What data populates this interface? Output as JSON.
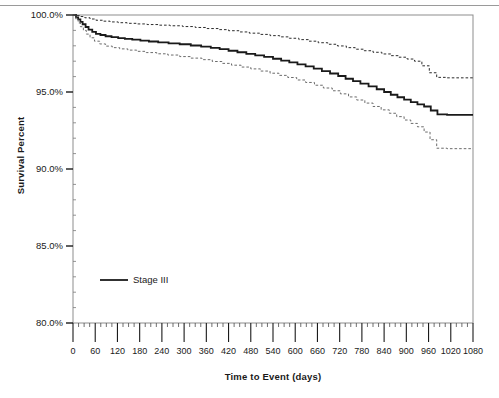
{
  "figure": {
    "background_color": "#ffffff",
    "top_rule_color": "#9a9a9a",
    "frame_color": "#888888",
    "axis_color": "#1a1a1a"
  },
  "legend": {
    "entries": [
      {
        "label": "Stage III",
        "style": "solid",
        "color": "#1a1a1a"
      }
    ]
  },
  "chart_data": {
    "type": "line",
    "subtype": "kaplan-meier-step",
    "title": "",
    "xlabel": "Time to Event (days)",
    "ylabel": "Survival Percent",
    "xlim": [
      0,
      1080
    ],
    "ylim": [
      80,
      100
    ],
    "grid": false,
    "legend_position": "inside-lower-left",
    "x_major_step": 60,
    "x_minor_per_major": 4,
    "y_major_step": 5,
    "y_minor_per_major": 5,
    "xticks": [
      0,
      60,
      120,
      180,
      240,
      300,
      360,
      420,
      480,
      540,
      600,
      660,
      720,
      780,
      840,
      900,
      960,
      1020,
      1080
    ],
    "xticklabels": [
      "0",
      "60",
      "120",
      "180",
      "240",
      "300",
      "360",
      "420",
      "480",
      "540",
      "600",
      "660",
      "720",
      "780",
      "840",
      "900",
      "960",
      "1020",
      "1080"
    ],
    "yticks": [
      80,
      85,
      90,
      95,
      100
    ],
    "yticklabels": [
      "80.0%",
      "85.0%",
      "90.0%",
      "95.0%",
      "100.0%"
    ],
    "series": [
      {
        "name": "Stage III",
        "style": "solid",
        "color": "#1a1a1a",
        "width": 1.8,
        "points": [
          [
            0,
            100.0
          ],
          [
            8,
            99.85
          ],
          [
            14,
            99.72
          ],
          [
            20,
            99.55
          ],
          [
            26,
            99.4
          ],
          [
            34,
            99.22
          ],
          [
            42,
            99.05
          ],
          [
            52,
            98.9
          ],
          [
            62,
            98.78
          ],
          [
            74,
            98.7
          ],
          [
            88,
            98.62
          ],
          [
            104,
            98.56
          ],
          [
            122,
            98.5
          ],
          [
            140,
            98.45
          ],
          [
            160,
            98.4
          ],
          [
            182,
            98.34
          ],
          [
            205,
            98.28
          ],
          [
            230,
            98.22
          ],
          [
            258,
            98.16
          ],
          [
            288,
            98.1
          ],
          [
            318,
            98.02
          ],
          [
            346,
            97.94
          ],
          [
            372,
            97.86
          ],
          [
            396,
            97.78
          ],
          [
            420,
            97.68
          ],
          [
            444,
            97.58
          ],
          [
            468,
            97.48
          ],
          [
            492,
            97.38
          ],
          [
            516,
            97.28
          ],
          [
            540,
            97.16
          ],
          [
            562,
            97.04
          ],
          [
            584,
            96.92
          ],
          [
            606,
            96.8
          ],
          [
            628,
            96.66
          ],
          [
            650,
            96.52
          ],
          [
            672,
            96.36
          ],
          [
            694,
            96.2
          ],
          [
            716,
            96.04
          ],
          [
            736,
            95.86
          ],
          [
            756,
            95.7
          ],
          [
            776,
            95.54
          ],
          [
            798,
            95.36
          ],
          [
            820,
            95.18
          ],
          [
            840,
            95.0
          ],
          [
            858,
            94.82
          ],
          [
            876,
            94.66
          ],
          [
            894,
            94.5
          ],
          [
            912,
            94.34
          ],
          [
            930,
            94.2
          ],
          [
            948,
            94.06
          ],
          [
            966,
            93.8
          ],
          [
            984,
            93.55
          ],
          [
            1010,
            93.52
          ],
          [
            1080,
            93.52
          ]
        ]
      },
      {
        "name": "Upper 95% confidence limit",
        "style": "dashed",
        "color": "#2b2b2b",
        "width": 1.0,
        "points": [
          [
            0,
            100.0
          ],
          [
            10,
            99.96
          ],
          [
            20,
            99.9
          ],
          [
            32,
            99.82
          ],
          [
            46,
            99.74
          ],
          [
            62,
            99.66
          ],
          [
            80,
            99.6
          ],
          [
            100,
            99.55
          ],
          [
            122,
            99.5
          ],
          [
            146,
            99.46
          ],
          [
            172,
            99.42
          ],
          [
            200,
            99.38
          ],
          [
            230,
            99.34
          ],
          [
            262,
            99.3
          ],
          [
            296,
            99.25
          ],
          [
            330,
            99.19
          ],
          [
            362,
            99.12
          ],
          [
            392,
            99.05
          ],
          [
            420,
            98.98
          ],
          [
            448,
            98.9
          ],
          [
            476,
            98.82
          ],
          [
            504,
            98.74
          ],
          [
            532,
            98.66
          ],
          [
            558,
            98.58
          ],
          [
            584,
            98.49
          ],
          [
            610,
            98.4
          ],
          [
            636,
            98.3
          ],
          [
            662,
            98.2
          ],
          [
            688,
            98.1
          ],
          [
            714,
            97.99
          ],
          [
            738,
            97.88
          ],
          [
            762,
            97.78
          ],
          [
            786,
            97.68
          ],
          [
            810,
            97.58
          ],
          [
            834,
            97.47
          ],
          [
            858,
            97.36
          ],
          [
            880,
            97.26
          ],
          [
            902,
            97.14
          ],
          [
            922,
            97.0
          ],
          [
            942,
            96.7
          ],
          [
            962,
            96.25
          ],
          [
            982,
            95.95
          ],
          [
            1010,
            95.92
          ],
          [
            1080,
            95.92
          ]
        ]
      },
      {
        "name": "Lower 95% confidence limit",
        "style": "dashed",
        "color": "#6b6b6b",
        "width": 1.0,
        "points": [
          [
            0,
            100.0
          ],
          [
            8,
            99.7
          ],
          [
            14,
            99.48
          ],
          [
            20,
            99.24
          ],
          [
            28,
            99.0
          ],
          [
            36,
            98.76
          ],
          [
            46,
            98.52
          ],
          [
            58,
            98.3
          ],
          [
            72,
            98.12
          ],
          [
            88,
            97.98
          ],
          [
            106,
            97.88
          ],
          [
            126,
            97.8
          ],
          [
            148,
            97.72
          ],
          [
            172,
            97.64
          ],
          [
            198,
            97.56
          ],
          [
            226,
            97.48
          ],
          [
            256,
            97.4
          ],
          [
            288,
            97.3
          ],
          [
            318,
            97.2
          ],
          [
            348,
            97.1
          ],
          [
            376,
            96.98
          ],
          [
            402,
            96.86
          ],
          [
            428,
            96.74
          ],
          [
            454,
            96.62
          ],
          [
            480,
            96.5
          ],
          [
            506,
            96.36
          ],
          [
            532,
            96.22
          ],
          [
            556,
            96.08
          ],
          [
            580,
            95.94
          ],
          [
            604,
            95.78
          ],
          [
            628,
            95.62
          ],
          [
            652,
            95.44
          ],
          [
            676,
            95.26
          ],
          [
            700,
            95.08
          ],
          [
            722,
            94.88
          ],
          [
            744,
            94.68
          ],
          [
            766,
            94.48
          ],
          [
            788,
            94.28
          ],
          [
            810,
            94.06
          ],
          [
            832,
            93.84
          ],
          [
            854,
            93.62
          ],
          [
            874,
            93.4
          ],
          [
            894,
            93.18
          ],
          [
            912,
            92.96
          ],
          [
            930,
            92.74
          ],
          [
            948,
            92.4
          ],
          [
            964,
            91.9
          ],
          [
            982,
            91.35
          ],
          [
            1010,
            91.32
          ],
          [
            1080,
            91.32
          ]
        ]
      }
    ]
  }
}
